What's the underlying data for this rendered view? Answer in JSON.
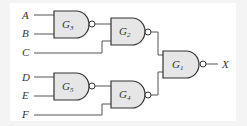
{
  "diagram": {
    "type": "logic-circuit",
    "gate_type": "NAND",
    "inputs": [
      "A",
      "B",
      "C",
      "D",
      "E",
      "F"
    ],
    "output": "X",
    "gates": [
      {
        "id": "G3",
        "label": "G",
        "sub": "3",
        "inputs": [
          "A",
          "B"
        ]
      },
      {
        "id": "G2",
        "label": "G",
        "sub": "2",
        "inputs": [
          "G3",
          "C"
        ]
      },
      {
        "id": "G5",
        "label": "G",
        "sub": "5",
        "inputs": [
          "D",
          "E"
        ]
      },
      {
        "id": "G4",
        "label": "G",
        "sub": "4",
        "inputs": [
          "G5",
          "F"
        ]
      },
      {
        "id": "G1",
        "label": "G",
        "sub": "1",
        "inputs": [
          "G2",
          "G4"
        ],
        "output": "X"
      }
    ],
    "labels": {
      "A": "A",
      "B": "B",
      "C": "C",
      "D": "D",
      "E": "E",
      "F": "F",
      "X": "X"
    },
    "colors": {
      "gate_fill": "#e6e6e6",
      "stroke": "#333333",
      "background": "#ffffff"
    }
  }
}
